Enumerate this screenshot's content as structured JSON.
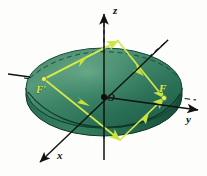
{
  "figure": {
    "background_color": "#fdfdfc"
  },
  "axes": {
    "z": {
      "label": "z",
      "direction": "up"
    },
    "y": {
      "label": "y",
      "direction": "right"
    },
    "x": {
      "label": "x",
      "direction": "lower-left"
    }
  },
  "points": {
    "origin": {
      "label": "O",
      "x": 104,
      "y": 97
    },
    "focus_left": {
      "label": "F′",
      "x": 44,
      "y": 79
    },
    "focus_right": {
      "label": "F",
      "x": 164,
      "y": 98
    }
  },
  "surface": {
    "name": "ellipsoid",
    "fill_light": "#5a9a7a",
    "fill_mid": "#2f7a5c",
    "fill_dark": "#1d5f46",
    "edge_color": "#0d3a2a",
    "semi_axis_a": 78,
    "semi_axis_b": 40,
    "body_depth": 22
  },
  "rays": {
    "color": "#d4e84a",
    "arrow_color": "#c8e038",
    "description": "Light rays emitted from focus F′ reflect off the ellipsoid surface and converge at focus F",
    "segments": [
      {
        "name": "upper-outgoing",
        "from": "focus_left",
        "to": "top-reflection"
      },
      {
        "name": "upper-incoming",
        "from": "top-reflection",
        "to": "focus_right"
      },
      {
        "name": "lower-outgoing",
        "from": "focus_left",
        "to": "bottom-reflection"
      },
      {
        "name": "lower-incoming",
        "from": "bottom-reflection",
        "to": "focus_right"
      }
    ]
  },
  "guides": {
    "dashed_color": "#1a1a1a",
    "items": [
      "major-axis-dashed",
      "x-axis-dashed",
      "z-axis-dashed-lower",
      "equator-dashed-back"
    ]
  }
}
